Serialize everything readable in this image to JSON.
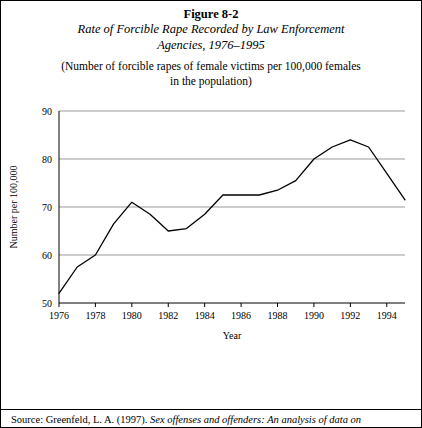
{
  "figure": {
    "number": "Figure 8-2",
    "title_line1": "Rate of Forcible Rape Recorded by Law Enforcement",
    "title_line2": "Agencies, 1976–1995",
    "subtitle_line1": "(Number of forcible rapes of female victims per 100,000 females",
    "subtitle_line2": "in the population)"
  },
  "source": {
    "lead": "Source: Greenfeld, L. A. (1997).",
    "italic": "Sex offenses and offenders: An analysis of data on"
  },
  "chart_data": {
    "type": "line",
    "title": "Rate of Forcible Rape Recorded by Law Enforcement Agencies, 1976–1995",
    "xlabel": "Year",
    "ylabel": "Number per 100,000",
    "xlim": [
      1976,
      1995
    ],
    "ylim": [
      50,
      90
    ],
    "yticks": [
      50,
      60,
      70,
      80,
      90
    ],
    "xticks": [
      1976,
      1978,
      1980,
      1982,
      1984,
      1986,
      1988,
      1990,
      1992,
      1994
    ],
    "grid": "horizontal",
    "legend": "none",
    "x": [
      1976,
      1977,
      1978,
      1979,
      1980,
      1981,
      1982,
      1983,
      1984,
      1985,
      1986,
      1987,
      1988,
      1989,
      1990,
      1991,
      1992,
      1993,
      1994,
      1995
    ],
    "values": [
      52.0,
      57.5,
      60.0,
      66.5,
      71.0,
      68.5,
      65.0,
      65.5,
      68.5,
      72.5,
      72.5,
      72.5,
      73.5,
      75.5,
      80.0,
      82.5,
      84.0,
      82.5,
      77.0,
      71.5
    ],
    "series": [
      {
        "name": "Rate per 100,000 females",
        "values": [
          52.0,
          57.5,
          60.0,
          66.5,
          71.0,
          68.5,
          65.0,
          65.5,
          68.5,
          72.5,
          72.5,
          72.5,
          73.5,
          75.5,
          80.0,
          82.5,
          84.0,
          82.5,
          77.0,
          71.5
        ]
      }
    ]
  }
}
